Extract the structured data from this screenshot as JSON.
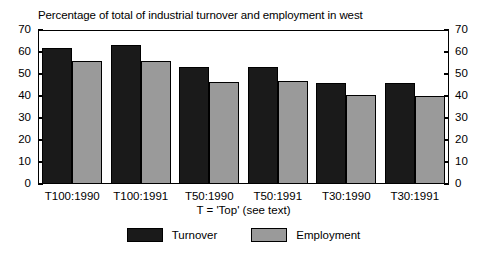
{
  "chart_data": {
    "type": "bar",
    "title": "Percentage of total of industrial turnover and employment in west",
    "xlabel": "T = 'Top' (see text)",
    "ylabel": "",
    "categories": [
      "T100:1990",
      "T100:1991",
      "T50:1990",
      "T50:1991",
      "T30:1990",
      "T30:1991"
    ],
    "series": [
      {
        "name": "Turnover",
        "color": "#1a1a1a",
        "values": [
          62,
          63,
          53,
          53,
          46,
          46
        ]
      },
      {
        "name": "Employment",
        "color": "#9a9a9a",
        "values": [
          56,
          56,
          46.5,
          47,
          40.5,
          40
        ]
      }
    ],
    "ylim": [
      0,
      70
    ],
    "y_ticks": [
      0,
      10,
      20,
      30,
      40,
      50,
      60,
      70
    ],
    "y_tick_labels_left": [
      "0",
      "10",
      "20",
      "30",
      "40",
      "50",
      "60",
      "70"
    ],
    "y_tick_labels_right": [
      "0",
      "10",
      "20",
      "30",
      "40",
      "50",
      "60",
      "70"
    ],
    "dual_axis": true,
    "grid": false,
    "legend_position": "bottom-center"
  }
}
